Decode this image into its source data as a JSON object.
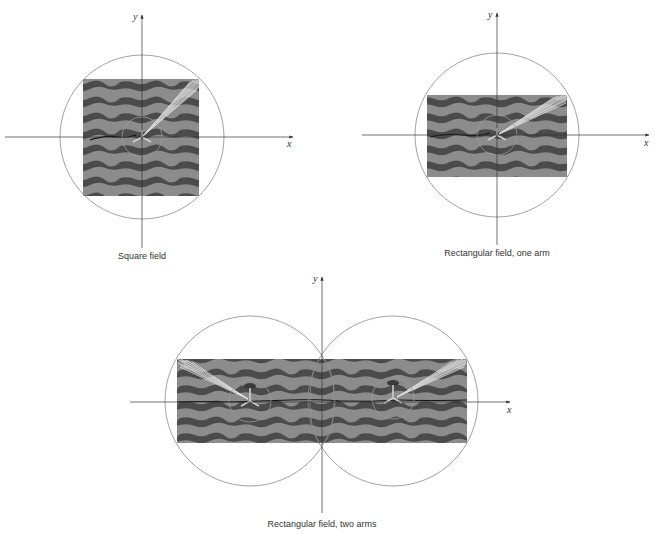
{
  "figure": {
    "colors": {
      "axis": "#333333",
      "circle": "#8a8a8a",
      "band_dark": "#4b4b4b",
      "band_light": "#8c8c8c",
      "spray": "#e8e8e8",
      "background": "#ffffff"
    },
    "panels": [
      {
        "id": "square",
        "caption": "Square field",
        "x_label": "x",
        "y_label": "y",
        "origin": [
          142,
          137
        ],
        "field": {
          "x": 83,
          "y": 79,
          "w": 116,
          "h": 117
        },
        "coverage_circles": [
          {
            "cx": 142,
            "cy": 137,
            "r": 82
          }
        ],
        "arms": [
          {
            "cx": 142,
            "cy": 137,
            "r": 20,
            "spray_to": [
              199,
              79
            ]
          }
        ],
        "x_axis": [
          5,
          293
        ],
        "y_axis": [
          15,
          248
        ]
      },
      {
        "id": "rect-one-arm",
        "caption": "Rectangular field, one arm",
        "x_label": "x",
        "y_label": "y",
        "origin": [
          497,
          135
        ],
        "field": {
          "x": 427,
          "y": 95,
          "w": 140,
          "h": 82
        },
        "coverage_circles": [
          {
            "cx": 497,
            "cy": 135,
            "r": 82
          }
        ],
        "arms": [
          {
            "cx": 497,
            "cy": 135,
            "r": 20,
            "spray_to": [
              567,
              95
            ]
          }
        ],
        "x_axis": [
          362,
          649
        ],
        "y_axis": [
          13,
          245
        ]
      },
      {
        "id": "rect-two-arms",
        "caption": "Rectangular field, two arms",
        "x_label": "x",
        "y_label": "y",
        "origin": [
          322,
          402
        ],
        "field": {
          "x": 177,
          "y": 359,
          "w": 290,
          "h": 84
        },
        "coverage_circles": [
          {
            "cx": 250,
            "cy": 401,
            "r": 85
          },
          {
            "cx": 393,
            "cy": 401,
            "r": 85
          }
        ],
        "arms": [
          {
            "cx": 250,
            "cy": 401,
            "r": 21,
            "spray_to": [
              177,
              359
            ]
          },
          {
            "cx": 393,
            "cy": 398,
            "r": 21,
            "spray_to": [
              467,
              359
            ]
          }
        ],
        "x_axis": [
          130,
          510
        ],
        "y_axis": [
          277,
          513
        ]
      }
    ]
  }
}
